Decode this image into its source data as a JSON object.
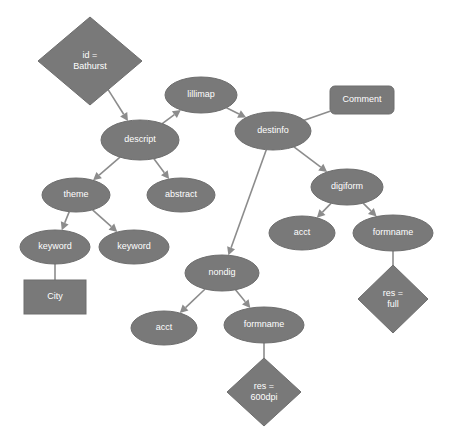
{
  "diagram": {
    "background_color": "#ffffff",
    "node_fill_color": "#797979",
    "node_stroke_color": "#6e6e6e",
    "edge_color": "#8c8c8c",
    "label_color": "#ffffff",
    "nodes": [
      {
        "id": "id_bathurst",
        "label": "id =\nBathurst",
        "lines": [
          "id =",
          "Bathurst"
        ],
        "shape": "diamond",
        "cx": 90,
        "cy": 61,
        "rx": 52,
        "ry": 44
      },
      {
        "id": "lillimap",
        "label": "lillimap",
        "lines": [
          "lillimap"
        ],
        "shape": "ellipse",
        "cx": 201,
        "cy": 95,
        "rx": 36,
        "ry": 18
      },
      {
        "id": "comment",
        "label": "Comment",
        "lines": [
          "Comment"
        ],
        "shape": "roundrect",
        "cx": 362,
        "cy": 100,
        "rx": 32,
        "ry": 14
      },
      {
        "id": "descript",
        "label": "descript",
        "lines": [
          "descript"
        ],
        "shape": "ellipse",
        "cx": 140,
        "cy": 140,
        "rx": 39,
        "ry": 20
      },
      {
        "id": "destinfo",
        "label": "destinfo",
        "lines": [
          "destinfo"
        ],
        "shape": "ellipse",
        "cx": 273,
        "cy": 131,
        "rx": 38,
        "ry": 19
      },
      {
        "id": "theme",
        "label": "theme",
        "lines": [
          "theme"
        ],
        "shape": "ellipse",
        "cx": 76,
        "cy": 195,
        "rx": 34,
        "ry": 17
      },
      {
        "id": "abstract",
        "label": "abstract",
        "lines": [
          "abstract"
        ],
        "shape": "ellipse",
        "cx": 181,
        "cy": 195,
        "rx": 34,
        "ry": 17
      },
      {
        "id": "digiform",
        "label": "digiform",
        "lines": [
          "digiform"
        ],
        "shape": "ellipse",
        "cx": 347,
        "cy": 187,
        "rx": 36,
        "ry": 18
      },
      {
        "id": "keyword_1",
        "label": "keyword",
        "lines": [
          "keyword"
        ],
        "shape": "ellipse",
        "cx": 55,
        "cy": 247,
        "rx": 35,
        "ry": 17
      },
      {
        "id": "keyword_2",
        "label": "keyword",
        "lines": [
          "keyword"
        ],
        "shape": "ellipse",
        "cx": 134,
        "cy": 247,
        "rx": 35,
        "ry": 17
      },
      {
        "id": "acct_digi",
        "label": "acct",
        "lines": [
          "acct"
        ],
        "shape": "ellipse",
        "cx": 302,
        "cy": 233,
        "rx": 33,
        "ry": 17
      },
      {
        "id": "formname_digi",
        "label": "formname",
        "lines": [
          "formname"
        ],
        "shape": "ellipse",
        "cx": 393,
        "cy": 233,
        "rx": 40,
        "ry": 18
      },
      {
        "id": "nondig",
        "label": "nondig",
        "lines": [
          "nondig"
        ],
        "shape": "ellipse",
        "cx": 222,
        "cy": 273,
        "rx": 37,
        "ry": 18
      },
      {
        "id": "city",
        "label": "City",
        "lines": [
          "City"
        ],
        "shape": "rect",
        "cx": 55,
        "cy": 297,
        "rx": 31,
        "ry": 17
      },
      {
        "id": "res_full",
        "label": "res =\nfull",
        "lines": [
          "res =",
          "full"
        ],
        "shape": "diamond",
        "cx": 393,
        "cy": 299,
        "rx": 35,
        "ry": 34
      },
      {
        "id": "acct_nondig",
        "label": "acct",
        "lines": [
          "acct"
        ],
        "shape": "ellipse",
        "cx": 164,
        "cy": 328,
        "rx": 33,
        "ry": 17
      },
      {
        "id": "formname_nondig",
        "label": "formname",
        "lines": [
          "formname"
        ],
        "shape": "ellipse",
        "cx": 264,
        "cy": 325,
        "rx": 40,
        "ry": 18
      },
      {
        "id": "res_600dpi",
        "label": "res =\n600dpi",
        "lines": [
          "res =",
          "600dpi"
        ],
        "shape": "diamond",
        "cx": 264,
        "cy": 392,
        "rx": 37,
        "ry": 34
      }
    ],
    "edges": [
      {
        "id": "e1",
        "from": "id_bathurst",
        "to": "descript",
        "arrow": true
      },
      {
        "id": "e2",
        "from": "descript",
        "to": "lillimap",
        "arrow": true
      },
      {
        "id": "e3",
        "from": "lillimap",
        "to": "destinfo",
        "arrow": true
      },
      {
        "id": "e4",
        "from": "destinfo",
        "to": "comment",
        "arrow": false
      },
      {
        "id": "e5",
        "from": "descript",
        "to": "theme",
        "arrow": true
      },
      {
        "id": "e6",
        "from": "descript",
        "to": "abstract",
        "arrow": true
      },
      {
        "id": "e7",
        "from": "destinfo",
        "to": "digiform",
        "arrow": true
      },
      {
        "id": "e8",
        "from": "destinfo",
        "to": "nondig",
        "arrow": true
      },
      {
        "id": "e9",
        "from": "theme",
        "to": "keyword_1",
        "arrow": true
      },
      {
        "id": "e10",
        "from": "theme",
        "to": "keyword_2",
        "arrow": true
      },
      {
        "id": "e11",
        "from": "keyword_1",
        "to": "city",
        "arrow": false
      },
      {
        "id": "e12",
        "from": "digiform",
        "to": "acct_digi",
        "arrow": true
      },
      {
        "id": "e13",
        "from": "digiform",
        "to": "formname_digi",
        "arrow": true
      },
      {
        "id": "e14",
        "from": "formname_digi",
        "to": "res_full",
        "arrow": false
      },
      {
        "id": "e15",
        "from": "nondig",
        "to": "acct_nondig",
        "arrow": true
      },
      {
        "id": "e16",
        "from": "nondig",
        "to": "formname_nondig",
        "arrow": true
      },
      {
        "id": "e17",
        "from": "formname_nondig",
        "to": "res_600dpi",
        "arrow": false
      }
    ]
  }
}
